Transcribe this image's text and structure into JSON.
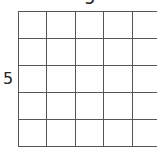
{
  "diagram": {
    "type": "grid",
    "rows": 5,
    "columns": 5,
    "top_label": "5",
    "left_label": "5",
    "line_color": "#555555",
    "background": "#ffffff"
  }
}
